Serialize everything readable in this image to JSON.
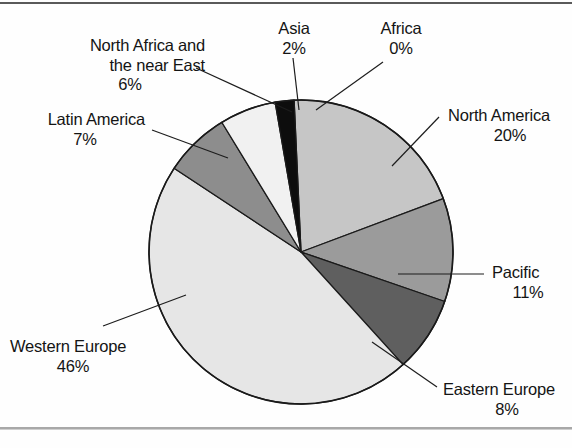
{
  "figure": {
    "background_color": "#fefefe",
    "frame_top_color": "#5a5a5a",
    "frame_bottom_color": "#a8a8a8"
  },
  "chart_data": {
    "type": "pie",
    "title": "",
    "subtitle": "",
    "xlabel": "",
    "ylabel": "",
    "legend_position": "callout-labels",
    "grid": false,
    "total_label": "100%",
    "start_angle_deg": -94,
    "direction": "clockwise",
    "center": {
      "x": 301,
      "y": 252
    },
    "radius": 152,
    "categories": [
      "Africa",
      "North America",
      "Pacific",
      "Eastern Europe",
      "Western Europe",
      "Latin America",
      "North Africa and the near East",
      "Asia"
    ],
    "values": [
      0,
      20,
      11,
      8,
      46,
      7,
      6,
      2
    ],
    "value_labels": [
      "0%",
      "20%",
      "11%",
      "8%",
      "46%",
      "7%",
      "6%",
      "2%"
    ],
    "colors": [
      "#0d0d0d",
      "#c6c6c6",
      "#9b9b9b",
      "#5f5f5f",
      "#e6e6e6",
      "#8d8d8d",
      "#f1f1f1",
      "#0d0d0d"
    ],
    "slice_edge_color": "#1a1a1a",
    "slices": [
      {
        "name": "Africa",
        "value": 0,
        "label": "Africa",
        "pct_label": "0%",
        "color": "#0d0d0d",
        "sweep_deg": 1.4
      },
      {
        "name": "North America",
        "value": 20,
        "label": "North America",
        "pct_label": "20%",
        "color": "#c6c6c6",
        "sweep_deg": 72
      },
      {
        "name": "Pacific",
        "value": 11,
        "label": "Pacific",
        "pct_label": "11%",
        "color": "#9b9b9b",
        "sweep_deg": 39.6
      },
      {
        "name": "Eastern Europe",
        "value": 8,
        "label": "Eastern Europe",
        "pct_label": "8%",
        "color": "#5f5f5f",
        "sweep_deg": 28.8
      },
      {
        "name": "Western Europe",
        "value": 46,
        "label": "Western Europe",
        "pct_label": "46%",
        "color": "#e6e6e6",
        "sweep_deg": 165.6
      },
      {
        "name": "Latin America",
        "value": 7,
        "label": "Latin America",
        "pct_label": "7%",
        "color": "#8d8d8d",
        "sweep_deg": 25.2
      },
      {
        "name": "North Africa and the near East",
        "value": 6,
        "label": "North Africa and the near East",
        "pct_label": "6%",
        "color": "#f1f1f1",
        "sweep_deg": 21.6
      },
      {
        "name": "Asia",
        "value": 2,
        "label": "Asia",
        "pct_label": "2%",
        "color": "#0d0d0d",
        "sweep_deg": 7.2
      }
    ]
  },
  "labels": {
    "north_africa": {
      "line1": "North Africa and",
      "line2": "the near East",
      "pct": "6%"
    },
    "latin_america": {
      "line1": "Latin America",
      "pct": "7%"
    },
    "western_europe": {
      "line1": "Western Europe",
      "pct": "46%"
    },
    "asia": {
      "line1": "Asia",
      "pct": "2%"
    },
    "africa": {
      "line1": "Africa",
      "pct": "0%"
    },
    "north_america": {
      "line1": "North America",
      "pct": "20%"
    },
    "pacific": {
      "line1": "Pacific",
      "pct": "11%"
    },
    "eastern_europe": {
      "line1": "Eastern Europe",
      "pct": "8%"
    }
  }
}
